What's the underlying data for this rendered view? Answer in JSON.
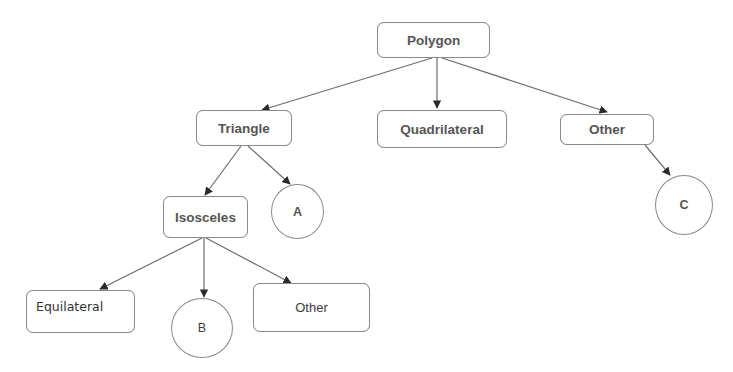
{
  "diagram": {
    "type": "tree",
    "background": "#ffffff",
    "line_color": "#6e6e6e",
    "border_color": "#8a8a8a",
    "nodes": {
      "polygon": {
        "label": "Polygon",
        "shape": "rounded-rect"
      },
      "triangle": {
        "label": "Triangle",
        "shape": "rounded-rect"
      },
      "quadrilateral": {
        "label": "Quadrilateral",
        "shape": "rounded-rect"
      },
      "other_top": {
        "label": "Other",
        "shape": "rounded-rect"
      },
      "isosceles": {
        "label": "Isosceles",
        "shape": "rounded-rect"
      },
      "circle_a": {
        "label": "A",
        "shape": "circle"
      },
      "circle_c": {
        "label": "C",
        "shape": "circle"
      },
      "equilateral": {
        "label": "Equilateral",
        "shape": "rounded-rect"
      },
      "circle_b": {
        "label": "B",
        "shape": "circle"
      },
      "other_bottom": {
        "label": "Other",
        "shape": "rounded-rect"
      }
    },
    "edges": [
      {
        "from": "Polygon",
        "to": "Triangle"
      },
      {
        "from": "Polygon",
        "to": "Quadrilateral"
      },
      {
        "from": "Polygon",
        "to": "Other"
      },
      {
        "from": "Triangle",
        "to": "Isosceles"
      },
      {
        "from": "Triangle",
        "to": "A"
      },
      {
        "from": "Other",
        "to": "C"
      },
      {
        "from": "Isosceles",
        "to": "Equilateral"
      },
      {
        "from": "Isosceles",
        "to": "B"
      },
      {
        "from": "Isosceles",
        "to": "Other"
      }
    ]
  }
}
